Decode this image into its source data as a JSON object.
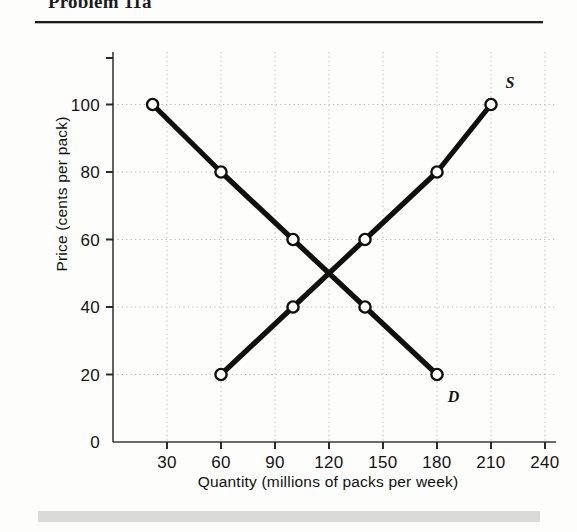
{
  "header": {
    "title": "Problem 11a"
  },
  "chart_data": {
    "type": "line",
    "title": "Problem 11a",
    "xlabel": "Quantity (millions of packs per week)",
    "ylabel": "Price (cents per pack)",
    "xlim": [
      0,
      250
    ],
    "ylim": [
      0,
      115
    ],
    "xticks": [
      "30",
      "60",
      "90",
      "120",
      "150",
      "180",
      "210",
      "240"
    ],
    "xtick_values": [
      30,
      60,
      90,
      120,
      150,
      180,
      210,
      240
    ],
    "yticks": [
      "0",
      "20",
      "40",
      "60",
      "80",
      "100"
    ],
    "ytick_values": [
      0,
      20,
      40,
      60,
      80,
      100
    ],
    "grid": true,
    "grid_style": "dotted",
    "grid_color": "#b9b9b9",
    "legend": "inline-curve-labels",
    "marker": "open-circle",
    "line_color": "#101010",
    "series": [
      {
        "name": "D",
        "label": "D",
        "description": "Demand curve",
        "x": [
          22,
          60,
          100,
          140,
          180
        ],
        "y": [
          100,
          80,
          60,
          40,
          20
        ],
        "label_x": 186,
        "label_y": 12
      },
      {
        "name": "S",
        "label": "S",
        "description": "Supply curve",
        "x": [
          60,
          100,
          140,
          180,
          210
        ],
        "y": [
          20,
          40,
          60,
          80,
          100
        ],
        "label_x": 218,
        "label_y": 105
      }
    ],
    "equilibrium": {
      "quantity": 120,
      "price": 50
    },
    "annotations": [
      {
        "text": "S",
        "x": 218,
        "y": 105
      },
      {
        "text": "D",
        "x": 186,
        "y": 12
      }
    ]
  }
}
